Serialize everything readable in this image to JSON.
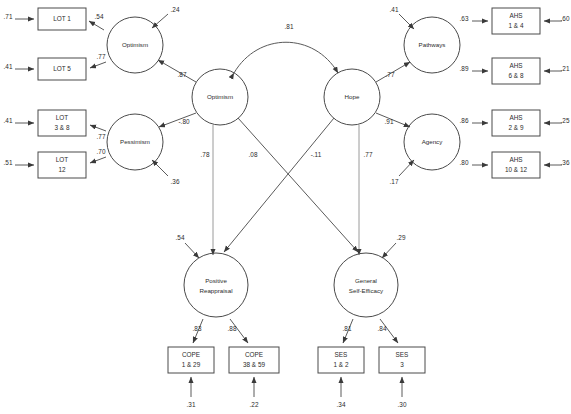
{
  "diagram": {
    "type": "structural-equation-model",
    "observed_variables": [
      {
        "id": "lot1",
        "lines": [
          "LOT 1"
        ],
        "residual": ".71",
        "loading": ".54"
      },
      {
        "id": "lot5",
        "lines": [
          "LOT 5"
        ],
        "residual": ".41",
        "loading": ".77"
      },
      {
        "id": "lot38",
        "lines": [
          "LOT",
          "3 & 8"
        ],
        "residual": ".41",
        "loading": ".77"
      },
      {
        "id": "lot12",
        "lines": [
          "LOT",
          "12"
        ],
        "residual": ".51",
        "loading": ".70"
      },
      {
        "id": "ahs14",
        "lines": [
          "AHS",
          "1 & 4"
        ],
        "residual": ".60",
        "loading": ".63"
      },
      {
        "id": "ahs68",
        "lines": [
          "AHS",
          "6 & 8"
        ],
        "residual": ".21",
        "loading": ".89"
      },
      {
        "id": "ahs29",
        "lines": [
          "AHS",
          "2 & 9"
        ],
        "residual": ".25",
        "loading": ".86"
      },
      {
        "id": "ahs1012",
        "lines": [
          "AHS",
          "10 & 12"
        ],
        "residual": ".36",
        "loading": ".80"
      },
      {
        "id": "cope129",
        "lines": [
          "COPE",
          "1 & 29"
        ],
        "residual": ".31",
        "loading": ".83"
      },
      {
        "id": "cope3859",
        "lines": [
          "COPE",
          "38 & 59"
        ],
        "residual": ".22",
        "loading": ".88"
      },
      {
        "id": "ses12",
        "lines": [
          "SES",
          "1 & 2"
        ],
        "residual": ".34",
        "loading": ".81"
      },
      {
        "id": "ses3",
        "lines": [
          "SES",
          "3"
        ],
        "residual": ".30",
        "loading": ".84"
      }
    ],
    "latent_variables": [
      {
        "id": "optimism-first",
        "lines": [
          "Optimism"
        ],
        "disturbance": ".24"
      },
      {
        "id": "pessimism",
        "lines": [
          "Pessimism"
        ],
        "disturbance": ".36"
      },
      {
        "id": "optimism-second",
        "lines": [
          "Optimism"
        ],
        "disturbance": null
      },
      {
        "id": "hope",
        "lines": [
          "Hope"
        ],
        "disturbance": null
      },
      {
        "id": "pathways",
        "lines": [
          "Pathways"
        ],
        "disturbance": ".41"
      },
      {
        "id": "agency",
        "lines": [
          "Agency"
        ],
        "disturbance": ".17"
      },
      {
        "id": "positive-reappraisal",
        "lines": [
          "Positive",
          "Reappraisal"
        ],
        "disturbance": ".54"
      },
      {
        "id": "general-self-efficacy",
        "lines": [
          "General",
          "Self-Efficacy"
        ],
        "disturbance": ".29"
      }
    ],
    "structural_paths": [
      {
        "id": "opt2-to-opt1",
        "from": "optimism-second",
        "to": "optimism-first",
        "coefficient": ".87"
      },
      {
        "id": "opt2-to-pess",
        "from": "optimism-second",
        "to": "pessimism",
        "coefficient": "-.80"
      },
      {
        "id": "hope-to-pathways",
        "from": "hope",
        "to": "pathways",
        "coefficient": ".77"
      },
      {
        "id": "hope-to-agency",
        "from": "hope",
        "to": "agency",
        "coefficient": ".91"
      },
      {
        "id": "opt2-to-posreap",
        "from": "optimism-second",
        "to": "positive-reappraisal",
        "coefficient": ".78"
      },
      {
        "id": "opt2-to-gse",
        "from": "optimism-second",
        "to": "general-self-efficacy",
        "coefficient": ".08"
      },
      {
        "id": "hope-to-posreap",
        "from": "hope",
        "to": "positive-reappraisal",
        "coefficient": "-.11"
      },
      {
        "id": "hope-to-gse",
        "from": "hope",
        "to": "general-self-efficacy",
        "coefficient": ".77"
      }
    ],
    "correlations": [
      {
        "id": "opt2-hope-correlation",
        "between": [
          "optimism-second",
          "hope"
        ],
        "coefficient": ".81"
      }
    ],
    "colors": {
      "stroke": "#4a4a4a",
      "path": "#5a5a5a",
      "background": "#ffffff",
      "text": "#2b2b2b"
    }
  }
}
